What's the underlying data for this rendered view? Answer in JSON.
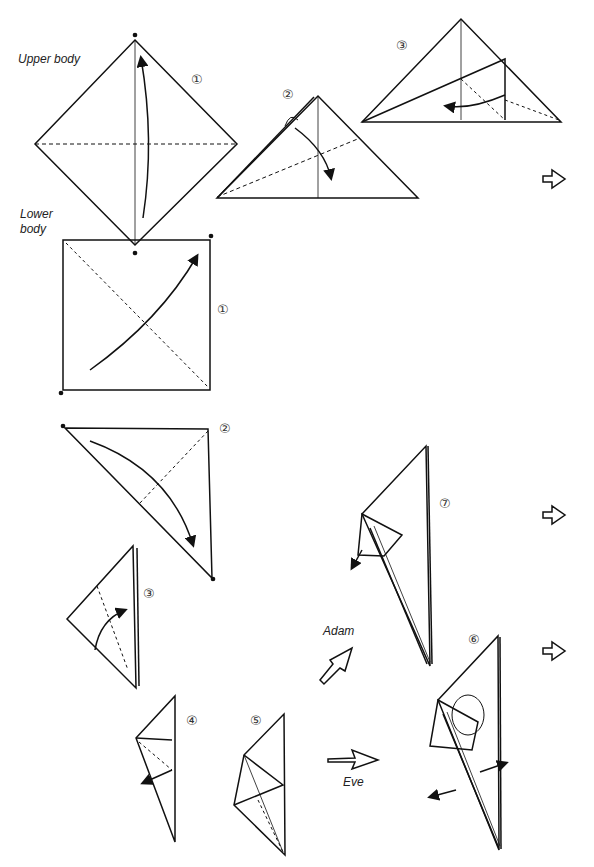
{
  "labels": {
    "upper_body": "Upper body",
    "lower_body_line1": "Lower",
    "lower_body_line2": "body",
    "adam": "Adam",
    "eve": "Eve"
  },
  "steps": {
    "upper_1": "①",
    "upper_2": "②",
    "upper_3": "③",
    "lower_1": "①",
    "lower_2": "②",
    "lower_3": "③",
    "lower_4": "④",
    "lower_5": "⑤",
    "lower_6": "⑥",
    "lower_7": "⑦"
  },
  "icons": {
    "continue_arrow": "continue-arrow-icon",
    "adam_arrow": "hollow-arrow-icon",
    "eve_arrow": "hollow-arrow-icon"
  },
  "colors": {
    "ink": "#111111",
    "paper": "#ffffff"
  }
}
